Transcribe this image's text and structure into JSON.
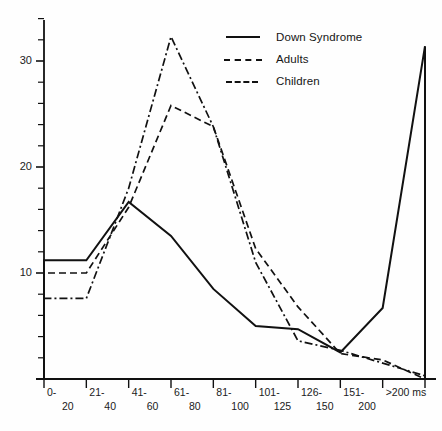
{
  "chart_data": {
    "type": "line",
    "subtype": "step-histogram",
    "title": "",
    "xlabel": "ms",
    "ylabel": "",
    "categories": [
      "0-20",
      "21-40",
      "41-60",
      "61-80",
      "81-100",
      "101-125",
      "126-150",
      "151-200",
      ">200 ms"
    ],
    "category_labels_top": [
      "0-",
      "21-",
      "41-",
      "61-",
      "81-",
      "101-",
      "126-",
      "151-",
      ">200 ms"
    ],
    "category_labels_bottom": [
      "20",
      "40",
      "60",
      "80",
      "100",
      "125",
      "150",
      "200",
      ""
    ],
    "ylim": [
      0,
      34
    ],
    "yticks_labeled": [
      10,
      20,
      30
    ],
    "ytick_interval_minor": 2,
    "grid": false,
    "legend_position": "top-right",
    "series": [
      {
        "name": "Down Syndrome",
        "style": "solid",
        "values": [
          11.2,
          16.7,
          13.5,
          8.5,
          5.0,
          4.7,
          2.5,
          6.7,
          31.4
        ]
      },
      {
        "name": "Adults",
        "style": "dash-dot",
        "values": [
          7.6,
          18.0,
          32.3,
          23.8,
          11.0,
          3.6,
          2.7,
          1.5,
          0.3
        ]
      },
      {
        "name": "Children",
        "style": "dashed",
        "values": [
          10.0,
          16.2,
          25.8,
          23.8,
          12.3,
          6.8,
          2.4,
          1.8,
          0.0
        ]
      }
    ]
  },
  "legend": {
    "items": [
      {
        "label": "Down Syndrome",
        "key": "solid-line-key"
      },
      {
        "label": "Adults",
        "key": "dash-dot-line-key"
      },
      {
        "label": "Children",
        "key": "dashed-line-key"
      }
    ]
  },
  "axis": {
    "y_labels": [
      "30",
      "20",
      "10"
    ],
    "x_top": [
      "0-",
      "21-",
      "41-",
      "61-",
      "81-",
      "101-",
      "126-",
      "151-",
      ">200 ms"
    ],
    "x_bottom": [
      "20",
      "40",
      "60",
      "80",
      "100",
      "125",
      "150",
      "200"
    ]
  },
  "colors": {
    "ink": "#111111",
    "background": "#fefefe"
  }
}
